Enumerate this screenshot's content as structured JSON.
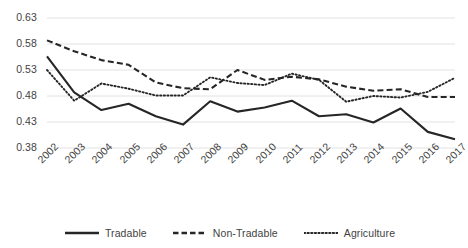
{
  "chart_data": {
    "type": "line",
    "title": "",
    "xlabel": "",
    "ylabel": "",
    "categories": [
      "2002",
      "2003",
      "2004",
      "2005",
      "2006",
      "2007",
      "2008",
      "2009",
      "2010",
      "2011",
      "2012",
      "2013",
      "2014",
      "2015",
      "2016",
      "2017"
    ],
    "ylim": [
      0.38,
      0.63
    ],
    "yticks": [
      0.38,
      0.43,
      0.48,
      0.53,
      0.58,
      0.63
    ],
    "ytick_labels": [
      "0.38",
      "0.43",
      "0.48",
      "0.53",
      "0.58",
      "0.63"
    ],
    "grid": true,
    "legend_position": "bottom",
    "series": [
      {
        "name": "Tradable",
        "style": "solid",
        "color": "#262626",
        "values": [
          0.556,
          0.487,
          0.453,
          0.465,
          0.441,
          0.425,
          0.47,
          0.45,
          0.458,
          0.471,
          0.441,
          0.445,
          0.429,
          0.456,
          0.411,
          0.397
        ]
      },
      {
        "name": "Non-Tradable",
        "style": "dashed",
        "color": "#262626",
        "values": [
          0.587,
          0.566,
          0.549,
          0.54,
          0.506,
          0.495,
          0.493,
          0.53,
          0.511,
          0.517,
          0.512,
          0.498,
          0.49,
          0.493,
          0.478,
          0.478
        ]
      },
      {
        "name": "Agriculture",
        "style": "dotted",
        "color": "#262626",
        "values": [
          0.53,
          0.471,
          0.504,
          0.494,
          0.481,
          0.481,
          0.516,
          0.505,
          0.501,
          0.523,
          0.511,
          0.469,
          0.48,
          0.477,
          0.488,
          0.515
        ]
      }
    ]
  },
  "axes": {
    "y_labels": [
      "0.63",
      "0.58",
      "0.53",
      "0.48",
      "0.43",
      "0.38"
    ],
    "x_labels": [
      "2002",
      "2003",
      "2004",
      "2005",
      "2006",
      "2007",
      "2008",
      "2009",
      "2010",
      "2011",
      "2012",
      "2013",
      "2014",
      "2015",
      "2016",
      "2017"
    ]
  },
  "legend": {
    "items": [
      {
        "label": "Tradable",
        "style": "solid"
      },
      {
        "label": "Non-Tradable",
        "style": "dashed"
      },
      {
        "label": "Agriculture",
        "style": "dotted"
      }
    ]
  },
  "style": {
    "line_color": "#262626",
    "grid_color": "#e2e2e2",
    "text_color": "#3f3f3f",
    "background": "#ffffff"
  }
}
